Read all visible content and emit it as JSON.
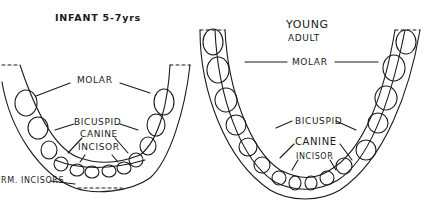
{
  "diagram": {
    "infant": {
      "title": "INFANT 5-7yrs",
      "labels": {
        "molar": "MOLAR",
        "bicuspid": "BICUSPID",
        "canine": "CANINE",
        "incisor": "INCISOR",
        "perm_incisors": "PERM. INCISORS"
      }
    },
    "adult": {
      "title_line1": "YOUNG",
      "title_line2": "ADULT",
      "labels": {
        "molar": "MOLAR",
        "bicuspid": "BICUSPID",
        "canine": "CANINE",
        "incisor": "INCISOR"
      }
    },
    "colors": {
      "ink": "#1a1a1a",
      "background": "#ffffff"
    }
  }
}
